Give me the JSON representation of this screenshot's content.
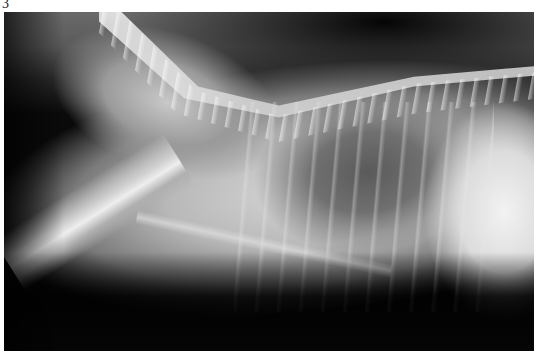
{
  "figure": {
    "label": "3"
  }
}
